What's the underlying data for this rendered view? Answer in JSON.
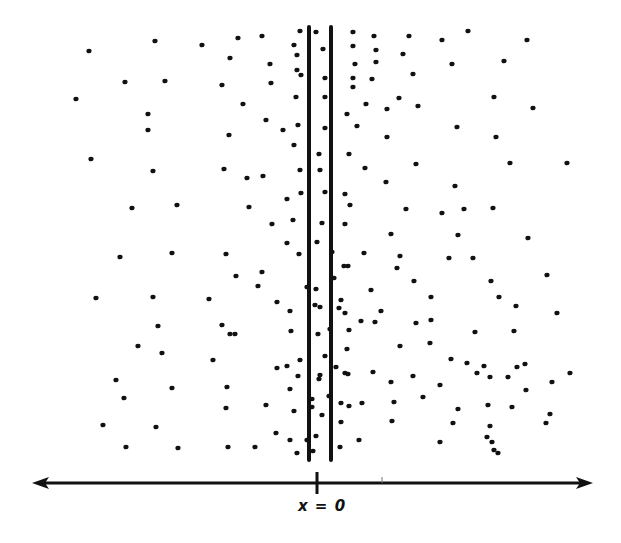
{
  "diagram": {
    "axis": {
      "label": "x = 0",
      "y": 483,
      "x_start": 32,
      "x_end": 593,
      "origin_x": 317,
      "tick_right_x": 382,
      "color": "#111111"
    },
    "vertical_lines": [
      {
        "x": 309,
        "y_top": 27,
        "y_bottom": 460
      },
      {
        "x": 331,
        "y_top": 27,
        "y_bottom": 460
      }
    ],
    "dot_color": "#111111",
    "dots": [
      [
        89,
        51
      ],
      [
        155,
        41
      ],
      [
        202,
        45
      ],
      [
        238,
        38
      ],
      [
        262,
        36
      ],
      [
        300,
        31
      ],
      [
        316,
        32
      ],
      [
        353,
        32
      ],
      [
        374,
        36
      ],
      [
        409,
        36
      ],
      [
        442,
        40
      ],
      [
        468,
        31
      ],
      [
        527,
        40
      ],
      [
        294,
        45
      ],
      [
        297,
        55
      ],
      [
        323,
        49
      ],
      [
        353,
        46
      ],
      [
        376,
        50
      ],
      [
        403,
        54
      ],
      [
        230,
        58
      ],
      [
        270,
        64
      ],
      [
        297,
        70
      ],
      [
        355,
        64
      ],
      [
        376,
        62
      ],
      [
        452,
        64
      ],
      [
        504,
        61
      ],
      [
        125,
        82
      ],
      [
        165,
        81
      ],
      [
        222,
        85
      ],
      [
        271,
        83
      ],
      [
        301,
        75
      ],
      [
        325,
        78
      ],
      [
        353,
        78
      ],
      [
        372,
        79
      ],
      [
        413,
        74
      ],
      [
        353,
        87
      ],
      [
        296,
        97
      ],
      [
        325,
        97
      ],
      [
        76,
        99
      ],
      [
        243,
        104
      ],
      [
        399,
        98
      ],
      [
        418,
        106
      ],
      [
        494,
        97
      ],
      [
        533,
        108
      ],
      [
        366,
        104
      ],
      [
        387,
        109
      ],
      [
        148,
        114
      ],
      [
        266,
        120
      ],
      [
        347,
        114
      ],
      [
        148,
        130
      ],
      [
        229,
        135
      ],
      [
        283,
        130
      ],
      [
        298,
        125
      ],
      [
        325,
        128
      ],
      [
        357,
        126
      ],
      [
        387,
        137
      ],
      [
        457,
        127
      ],
      [
        496,
        137
      ],
      [
        294,
        145
      ],
      [
        319,
        154
      ],
      [
        349,
        154
      ],
      [
        91,
        159
      ],
      [
        153,
        171
      ],
      [
        224,
        169
      ],
      [
        247,
        178
      ],
      [
        263,
        176
      ],
      [
        300,
        170
      ],
      [
        320,
        170
      ],
      [
        365,
        168
      ],
      [
        416,
        164
      ],
      [
        510,
        163
      ],
      [
        567,
        163
      ],
      [
        386,
        182
      ],
      [
        455,
        186
      ],
      [
        287,
        199
      ],
      [
        301,
        193
      ],
      [
        325,
        192
      ],
      [
        345,
        194
      ],
      [
        350,
        205
      ],
      [
        406,
        209
      ],
      [
        442,
        213
      ],
      [
        464,
        209
      ],
      [
        493,
        208
      ],
      [
        132,
        208
      ],
      [
        177,
        205
      ],
      [
        249,
        207
      ],
      [
        272,
        224
      ],
      [
        293,
        220
      ],
      [
        322,
        223
      ],
      [
        345,
        224
      ],
      [
        391,
        234
      ],
      [
        458,
        235
      ],
      [
        528,
        238
      ],
      [
        287,
        243
      ],
      [
        317,
        242
      ],
      [
        332,
        252
      ],
      [
        120,
        257
      ],
      [
        172,
        253
      ],
      [
        226,
        254
      ],
      [
        299,
        254
      ],
      [
        348,
        266
      ],
      [
        400,
        256
      ],
      [
        364,
        253
      ],
      [
        449,
        258
      ],
      [
        473,
        258
      ],
      [
        262,
        272
      ],
      [
        236,
        276
      ],
      [
        334,
        278
      ],
      [
        397,
        268
      ],
      [
        344,
        266
      ],
      [
        414,
        281
      ],
      [
        491,
        281
      ],
      [
        153,
        297
      ],
      [
        307,
        287
      ],
      [
        316,
        289
      ],
      [
        258,
        286
      ],
      [
        371,
        290
      ],
      [
        96,
        298
      ],
      [
        209,
        299
      ],
      [
        277,
        302
      ],
      [
        341,
        300
      ],
      [
        431,
        297
      ],
      [
        499,
        297
      ],
      [
        547,
        275
      ],
      [
        290,
        311
      ],
      [
        320,
        307
      ],
      [
        345,
        313
      ],
      [
        222,
        325
      ],
      [
        315,
        305
      ],
      [
        339,
        308
      ],
      [
        381,
        311
      ],
      [
        416,
        323
      ],
      [
        557,
        313
      ],
      [
        516,
        306
      ],
      [
        158,
        326
      ],
      [
        291,
        331
      ],
      [
        318,
        334
      ],
      [
        349,
        330
      ],
      [
        375,
        322
      ],
      [
        330,
        329
      ],
      [
        361,
        321
      ],
      [
        431,
        320
      ],
      [
        475,
        332
      ],
      [
        514,
        331
      ],
      [
        235,
        334
      ],
      [
        230,
        334
      ],
      [
        347,
        349
      ],
      [
        400,
        346
      ],
      [
        430,
        343
      ],
      [
        300,
        360
      ],
      [
        325,
        356
      ],
      [
        336,
        367
      ],
      [
        373,
        372
      ],
      [
        451,
        359
      ],
      [
        484,
        366
      ],
      [
        467,
        363
      ],
      [
        517,
        367
      ],
      [
        138,
        346
      ],
      [
        162,
        353
      ],
      [
        213,
        360
      ],
      [
        298,
        376
      ],
      [
        320,
        375
      ],
      [
        348,
        374
      ],
      [
        413,
        376
      ],
      [
        477,
        373
      ],
      [
        508,
        377
      ],
      [
        570,
        373
      ],
      [
        116,
        380
      ],
      [
        172,
        388
      ],
      [
        227,
        387
      ],
      [
        277,
        368
      ],
      [
        290,
        389
      ],
      [
        329,
        396
      ],
      [
        345,
        373
      ],
      [
        287,
        366
      ],
      [
        319,
        379
      ],
      [
        391,
        382
      ],
      [
        440,
        385
      ],
      [
        525,
        364
      ],
      [
        490,
        377
      ],
      [
        266,
        405
      ],
      [
        312,
        399
      ],
      [
        349,
        406
      ],
      [
        423,
        397
      ],
      [
        552,
        382
      ],
      [
        550,
        414
      ],
      [
        488,
        405
      ],
      [
        526,
        390
      ],
      [
        124,
        398
      ],
      [
        226,
        408
      ],
      [
        294,
        411
      ],
      [
        312,
        407
      ],
      [
        341,
        403
      ],
      [
        362,
        403
      ],
      [
        394,
        402
      ],
      [
        458,
        409
      ],
      [
        512,
        407
      ],
      [
        490,
        426
      ],
      [
        103,
        425
      ],
      [
        156,
        427
      ],
      [
        276,
        433
      ],
      [
        322,
        415
      ],
      [
        341,
        422
      ],
      [
        392,
        421
      ],
      [
        453,
        423
      ],
      [
        487,
        437
      ],
      [
        546,
        423
      ],
      [
        126,
        447
      ],
      [
        178,
        448
      ],
      [
        228,
        447
      ],
      [
        255,
        447
      ],
      [
        290,
        440
      ],
      [
        316,
        436
      ],
      [
        313,
        451
      ],
      [
        340,
        447
      ],
      [
        359,
        440
      ],
      [
        440,
        442
      ],
      [
        494,
        450
      ],
      [
        492,
        442
      ],
      [
        498,
        453
      ],
      [
        297,
        453
      ],
      [
        307,
        440
      ]
    ]
  }
}
